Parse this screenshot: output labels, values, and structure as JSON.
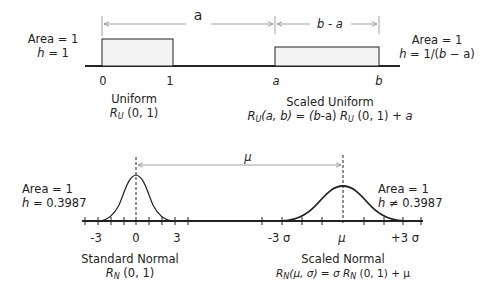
{
  "uniform": {
    "area_label": "Area = 1",
    "h_label_var": "h",
    "h_label_rest": " = 1",
    "ticks": [
      "0",
      "1"
    ],
    "name": "Uniform",
    "formula_R": "R",
    "formula_sub": "U",
    "formula_rest": " (0, 1)"
  },
  "scaled_uniform": {
    "area_label": "Area = 1",
    "h_label_var": "h",
    "h_label_rest": " = 1/(",
    "h_label_b": "b",
    "h_label_end": " − a)",
    "ticks": [
      "a",
      "b"
    ],
    "name": "Scaled Uniform",
    "formula_left": "(a, b) = (",
    "formula_b": "b",
    "formula_mid": "-a) ",
    "formula_right": " (0, 1) + ",
    "formula_a": "a"
  },
  "dimension_arrows": {
    "a_label": "a",
    "b_minus_a_label": "b - a",
    "mu_label": "μ"
  },
  "standard_normal": {
    "area_label": "Area = 1",
    "h_label_var": "h",
    "h_label_rest": " = 0.3987",
    "ticks": [
      "-3",
      "0",
      "3"
    ],
    "name": "Standard Normal",
    "formula_sub": "N",
    "formula_rest": " (0, 1)"
  },
  "scaled_normal": {
    "area_label": "Area = 1",
    "h_label_var": "h",
    "h_label_rest": " ≠ 0.3987",
    "ticks": [
      "-3 σ",
      "μ",
      "+3 σ"
    ],
    "name": "Scaled Normal",
    "formula_args": "(μ, σ)",
    "formula_eq": " =  σ ",
    "formula_rest": " (0, 1) + μ"
  },
  "colors": {
    "line": "#222222",
    "box_fill": "#f4f4f4",
    "arrow": "#888888"
  }
}
